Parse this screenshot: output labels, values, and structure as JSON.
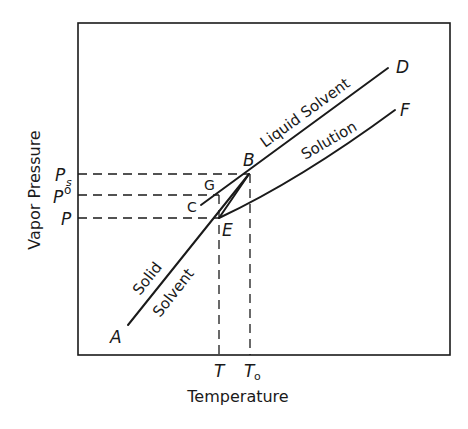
{
  "diagram": {
    "axes": {
      "x_label": "Temperature",
      "y_label": "Vapor Pressure"
    },
    "y_ticks": [
      {
        "label": "P",
        "sub": "s",
        "y": 174
      },
      {
        "label": "P",
        "sup": "o",
        "y": 195
      },
      {
        "label": "P",
        "y": 218
      }
    ],
    "x_ticks": [
      {
        "label": "T",
        "x": 219
      },
      {
        "label": "T",
        "sub": "o",
        "x": 250
      }
    ],
    "points": {
      "A": "A",
      "B": "B",
      "C": "C",
      "D": "D",
      "E": "E",
      "F": "F",
      "G": "G"
    },
    "curve_labels": {
      "liquid_solvent": "Liquid Solvent",
      "solution": "Solution",
      "solid": "Solid",
      "solvent": "Solvent"
    },
    "colors": {
      "ink": "#1a1a1a",
      "background": "#ffffff"
    }
  }
}
